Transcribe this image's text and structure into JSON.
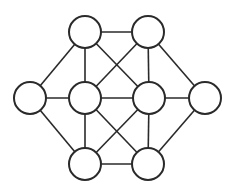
{
  "diagram": {
    "type": "graph",
    "colors": {
      "stroke": "#2a2a2a",
      "node_fill": "#ffffff",
      "background": "#ffffff"
    },
    "node_radius": 16,
    "nodes": [
      {
        "id": "TL",
        "x": 85,
        "y": 32
      },
      {
        "id": "TR",
        "x": 148,
        "y": 32
      },
      {
        "id": "L",
        "x": 30,
        "y": 98
      },
      {
        "id": "ML",
        "x": 85,
        "y": 98
      },
      {
        "id": "MR",
        "x": 149,
        "y": 98
      },
      {
        "id": "R",
        "x": 205,
        "y": 98
      },
      {
        "id": "BL",
        "x": 85,
        "y": 164
      },
      {
        "id": "BR",
        "x": 148,
        "y": 164
      }
    ],
    "edges": [
      [
        "TL",
        "TR"
      ],
      [
        "TL",
        "L"
      ],
      [
        "TL",
        "ML"
      ],
      [
        "TL",
        "MR"
      ],
      [
        "TR",
        "ML"
      ],
      [
        "TR",
        "MR"
      ],
      [
        "TR",
        "R"
      ],
      [
        "L",
        "ML"
      ],
      [
        "ML",
        "MR"
      ],
      [
        "MR",
        "R"
      ],
      [
        "L",
        "BL"
      ],
      [
        "ML",
        "BL"
      ],
      [
        "ML",
        "BR"
      ],
      [
        "MR",
        "BL"
      ],
      [
        "MR",
        "BR"
      ],
      [
        "R",
        "BR"
      ],
      [
        "BL",
        "BR"
      ]
    ]
  }
}
